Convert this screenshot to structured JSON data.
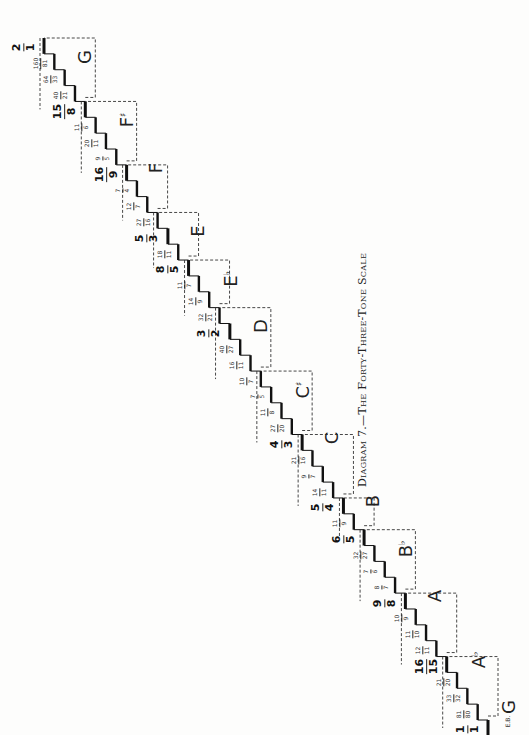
{
  "caption": "Diagram 7.—The Forty-Three-Tone Scale",
  "start_label": "G",
  "start_sub": "E.B.",
  "tones": [
    {
      "n": "1",
      "d": "1",
      "big": true
    },
    {
      "n": "81",
      "d": "80",
      "big": false
    },
    {
      "n": "33",
      "d": "32",
      "big": false
    },
    {
      "n": "21",
      "d": "20",
      "big": false
    },
    {
      "n": "16",
      "d": "15",
      "big": true
    },
    {
      "n": "12",
      "d": "11",
      "big": false
    },
    {
      "n": "11",
      "d": "10",
      "big": false
    },
    {
      "n": "10",
      "d": "9",
      "big": false
    },
    {
      "n": "9",
      "d": "8",
      "big": true
    },
    {
      "n": "8",
      "d": "7",
      "big": false
    },
    {
      "n": "7",
      "d": "6",
      "big": false
    },
    {
      "n": "32",
      "d": "27",
      "big": false
    },
    {
      "n": "6",
      "d": "5",
      "big": true
    },
    {
      "n": "11",
      "d": "9",
      "big": false
    },
    {
      "n": "5",
      "d": "4",
      "big": true
    },
    {
      "n": "14",
      "d": "11",
      "big": false
    },
    {
      "n": "9",
      "d": "7",
      "big": false
    },
    {
      "n": "21",
      "d": "16",
      "big": false
    },
    {
      "n": "4",
      "d": "3",
      "big": true
    },
    {
      "n": "27",
      "d": "20",
      "big": false
    },
    {
      "n": "11",
      "d": "8",
      "big": false
    },
    {
      "n": "7",
      "d": "5",
      "big": false
    },
    {
      "n": "10",
      "d": "7",
      "big": false
    },
    {
      "n": "16",
      "d": "11",
      "big": false
    },
    {
      "n": "40",
      "d": "27",
      "big": false
    },
    {
      "n": "3",
      "d": "2",
      "big": true
    },
    {
      "n": "32",
      "d": "21",
      "big": false
    },
    {
      "n": "14",
      "d": "9",
      "big": false
    },
    {
      "n": "11",
      "d": "7",
      "big": false
    },
    {
      "n": "8",
      "d": "5",
      "big": true
    },
    {
      "n": "18",
      "d": "11",
      "big": false
    },
    {
      "n": "5",
      "d": "3",
      "big": true
    },
    {
      "n": "27",
      "d": "16",
      "big": false
    },
    {
      "n": "12",
      "d": "7",
      "big": false
    },
    {
      "n": "7",
      "d": "4",
      "big": false
    },
    {
      "n": "16",
      "d": "9",
      "big": true
    },
    {
      "n": "9",
      "d": "5",
      "big": false
    },
    {
      "n": "20",
      "d": "11",
      "big": false
    },
    {
      "n": "11",
      "d": "6",
      "big": false
    },
    {
      "n": "15",
      "d": "8",
      "big": true
    },
    {
      "n": "40",
      "d": "21",
      "big": false
    },
    {
      "n": "64",
      "d": "33",
      "big": false
    },
    {
      "n": "160",
      "d": "81",
      "big": false
    },
    {
      "n": "2",
      "d": "1",
      "big": true
    }
  ],
  "notes": [
    {
      "name": "G",
      "acc": "",
      "at": 1
    },
    {
      "name": "A",
      "acc": "♭",
      "at": 4
    },
    {
      "name": "A",
      "acc": "",
      "at": 8
    },
    {
      "name": "B",
      "acc": "♭",
      "at": 11
    },
    {
      "name": "B",
      "acc": "",
      "at": 14
    },
    {
      "name": "C",
      "acc": "",
      "at": 18
    },
    {
      "name": "C",
      "acc": "♯",
      "at": 21
    },
    {
      "name": "D",
      "acc": "",
      "at": 25
    },
    {
      "name": "E",
      "acc": "♭",
      "at": 28
    },
    {
      "name": "E",
      "acc": "",
      "at": 31
    },
    {
      "name": "F",
      "acc": "",
      "at": 35
    },
    {
      "name": "F",
      "acc": "♯",
      "at": 38
    },
    {
      "name": "G",
      "acc": "",
      "at": 42
    }
  ],
  "dashed_boxes": [
    [
      0,
      4
    ],
    [
      4,
      8
    ],
    [
      8,
      12
    ],
    [
      12,
      14
    ],
    [
      14,
      18
    ],
    [
      18,
      22
    ],
    [
      22,
      26
    ],
    [
      26,
      29
    ],
    [
      29,
      32
    ],
    [
      32,
      35
    ],
    [
      35,
      39
    ],
    [
      39,
      43
    ]
  ],
  "colors": {
    "ink": "#111111",
    "paper": "#fdfdfc",
    "dash": "#333333"
  }
}
